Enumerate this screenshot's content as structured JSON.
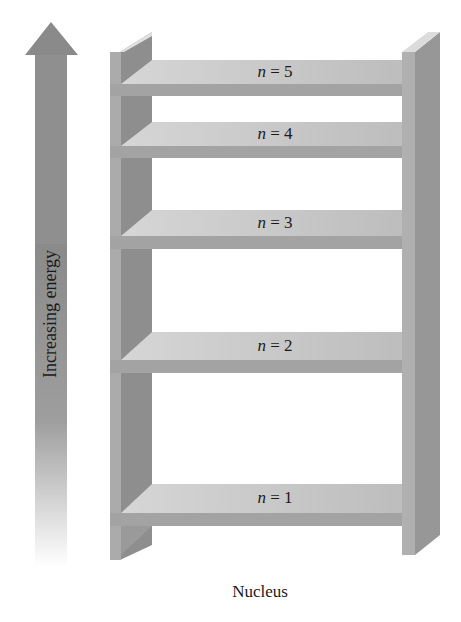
{
  "diagram": {
    "axis_label": "Increasing energy",
    "base_label": "Nucleus",
    "levels": [
      {
        "var": "n",
        "eq": " = ",
        "value": "5"
      },
      {
        "var": "n",
        "eq": " = ",
        "value": "4"
      },
      {
        "var": "n",
        "eq": " = ",
        "value": "3"
      },
      {
        "var": "n",
        "eq": " = ",
        "value": "2"
      },
      {
        "var": "n",
        "eq": " = ",
        "value": "1"
      }
    ],
    "colors": {
      "arrow": "#8f8f8f",
      "post_front": "#a8a8a8",
      "post_side": "#8c8c8c",
      "shelf_top": "#c9c9c9",
      "shelf_front": "#a6a6a6"
    }
  }
}
